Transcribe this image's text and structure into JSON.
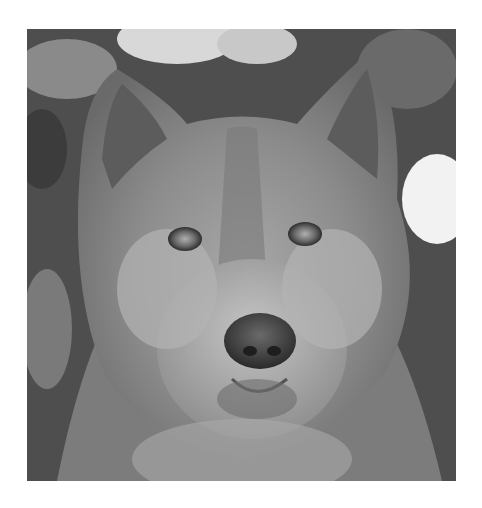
{
  "image": {
    "subject": "Grayscale close-up portrait of a wolf/malamute dog face with snowy foliage background",
    "alt": "Wolf-like dog face, black and white photo",
    "colors": {
      "page_background": "#ffffff",
      "fur_mid": "#8a8a8a",
      "fur_light": "#b8b8b8",
      "fur_dark": "#4a4a4a",
      "snow": "#f0f0f0",
      "nose": "#3a3a3a"
    }
  }
}
